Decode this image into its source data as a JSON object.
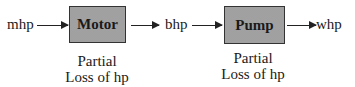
{
  "diagram": {
    "input_label": "mhp",
    "blocks": [
      {
        "label": "Motor",
        "caption_line1": "Partial",
        "caption_line2": "Loss of hp"
      },
      {
        "label": "Pump",
        "caption_line1": "Partial",
        "caption_line2": "Loss of hp"
      }
    ],
    "intermediate_label": "bhp",
    "output_label": "whp",
    "colors": {
      "box_fill": "#c9c9c9",
      "stroke": "#222222"
    }
  }
}
